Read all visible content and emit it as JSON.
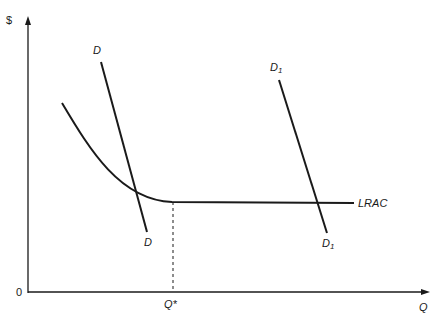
{
  "diagram": {
    "y_axis_label": "$",
    "x_axis_label": "Q",
    "origin_label": "0",
    "curves": {
      "lrac_label": "LRAC",
      "d_top_label": "D",
      "d_bottom_label": "D",
      "d1_top_base": "D",
      "d1_top_sub": "1",
      "d1_bottom_base": "D",
      "d1_bottom_sub": "1"
    },
    "q_star_label": "Q*",
    "colors": {
      "line": "#1a1a1a",
      "background": "#ffffff"
    }
  }
}
